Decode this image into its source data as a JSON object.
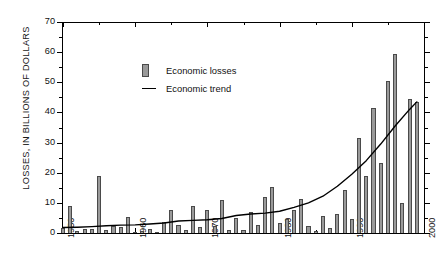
{
  "chart_data": {
    "type": "bar",
    "title": "",
    "xlabel": "",
    "ylabel": "LOSSES, IN BILLIONS OF DOLLARS",
    "ylim": [
      0,
      70
    ],
    "xlim": [
      1950,
      2000
    ],
    "ymajor_step": 10,
    "yminor_step": 5,
    "xmajor_step": 10,
    "xminor_step": 5,
    "grid": false,
    "legend_position": "upper-left-inside",
    "ytick_labels": [
      "0",
      "10",
      "20",
      "30",
      "40",
      "50",
      "60",
      "70"
    ],
    "ytick_values": [
      0,
      10,
      20,
      30,
      40,
      50,
      60,
      70
    ],
    "xtick_labels": [
      "1950",
      "1960",
      "1970",
      "1980",
      "1990",
      "2000"
    ],
    "xtick_values": [
      1950,
      1960,
      1970,
      1980,
      1990,
      2000
    ],
    "series": [
      {
        "name": "Economic losses",
        "type": "bar",
        "color": "#9a9a9a",
        "edge_color": "#4a4a4a",
        "x": [
          1950,
          1951,
          1952,
          1953,
          1954,
          1955,
          1956,
          1957,
          1958,
          1959,
          1960,
          1961,
          1962,
          1963,
          1964,
          1965,
          1966,
          1967,
          1968,
          1969,
          1970,
          1971,
          1972,
          1973,
          1974,
          1975,
          1976,
          1977,
          1978,
          1979,
          1980,
          1981,
          1982,
          1983,
          1984,
          1985,
          1986,
          1987,
          1988,
          1989,
          1990,
          1991,
          1992,
          1993,
          1994,
          1995,
          1996,
          1997,
          1998,
          1999
        ],
        "values": [
          1.6,
          8.8,
          0.6,
          1.4,
          1.2,
          19.0,
          1.0,
          2.2,
          1.9,
          5.3,
          0.5,
          0.6,
          1.2,
          0.5,
          3.7,
          7.7,
          2.5,
          1.1,
          9.0,
          2.1,
          7.8,
          2.3,
          11.0,
          1.1,
          4.9,
          1.0,
          7.0,
          2.6,
          11.8,
          15.4,
          3.3,
          4.5,
          7.8,
          11.4,
          2.4,
          0.8,
          5.6,
          1.5,
          6.2,
          14.2,
          4.6,
          31.6,
          19.0,
          41.6,
          23.3,
          50.5,
          59.4,
          9.8,
          44.6,
          43.6
        ]
      },
      {
        "name": "Economic trend",
        "type": "line",
        "color": "#000000",
        "x": [
          1950,
          1952,
          1954,
          1956,
          1958,
          1960,
          1962,
          1964,
          1966,
          1968,
          1970,
          1972,
          1974,
          1976,
          1978,
          1980,
          1982,
          1984,
          1986,
          1988,
          1990,
          1992,
          1994,
          1996,
          1998,
          1999
        ],
        "values": [
          1.8,
          1.9,
          2.1,
          2.4,
          2.6,
          2.7,
          3.0,
          3.3,
          4.0,
          4.2,
          4.4,
          4.8,
          5.8,
          6.3,
          6.6,
          7.2,
          8.5,
          10.0,
          12.2,
          15.5,
          19.5,
          24.0,
          29.5,
          35.5,
          41.0,
          43.5
        ]
      }
    ]
  },
  "legend": {
    "items": [
      {
        "label": "Economic losses",
        "marker": "bar-swatch"
      },
      {
        "label": "Economic trend",
        "marker": "line-swatch"
      }
    ]
  }
}
